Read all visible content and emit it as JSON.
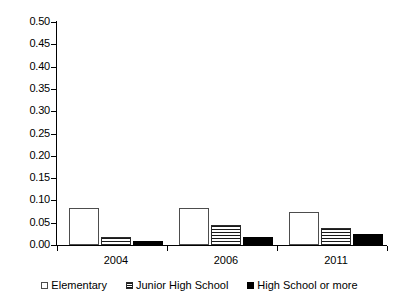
{
  "chart_data": {
    "type": "bar",
    "title": "",
    "subtitle": "",
    "xlabel": "",
    "ylabel": "",
    "categories": [
      "2004",
      "2006",
      "2011"
    ],
    "series": [
      {
        "name": "Elementary",
        "values": [
          0.083,
          0.082,
          0.074
        ],
        "style": "white-outline"
      },
      {
        "name": "Junior High School",
        "values": [
          0.018,
          0.045,
          0.038
        ],
        "style": "horizontal-stripes"
      },
      {
        "name": "High School or more",
        "values": [
          0.01,
          0.017,
          0.025
        ],
        "style": "solid-black"
      }
    ],
    "ylim": [
      0.0,
      0.5
    ],
    "ytick_step": 0.05,
    "ytick_labels": [
      "0.00",
      "0.05",
      "0.10",
      "0.15",
      "0.20",
      "0.25",
      "0.30",
      "0.35",
      "0.40",
      "0.45",
      "0.50"
    ],
    "ytick_values": [
      0.0,
      0.05,
      0.1,
      0.15,
      0.2,
      0.25,
      0.3,
      0.35,
      0.4,
      0.45,
      0.5
    ],
    "grid": false,
    "legend_position": "bottom",
    "legend_entries": [
      "Elementary",
      "Junior High School",
      "High School or more"
    ],
    "colors": {
      "elementary": "#ffffff",
      "junior_high_school": "#1a1a1a",
      "high_school_or_more": "#000000",
      "axis": "#000000",
      "background": "#ffffff"
    }
  }
}
